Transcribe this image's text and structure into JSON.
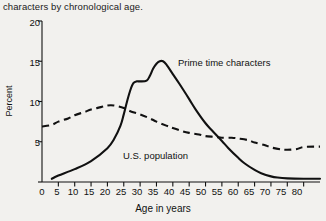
{
  "caption": "characters by chronological age.",
  "axis": {
    "ylabel": "Percent",
    "xlabel": "Age in years",
    "yticks": [
      "0",
      "5",
      "10",
      "15",
      "20"
    ],
    "xticks": [
      "0",
      "5",
      "10",
      "15",
      "20",
      "25",
      "30",
      "35",
      "40",
      "45",
      "50",
      "55",
      "60",
      "65",
      "70",
      "75",
      "80"
    ]
  },
  "labels": {
    "series1": "Prime time characters",
    "series2": "U.S. population"
  },
  "colors": {
    "ink": "#111111",
    "background": "#f2f1ee"
  },
  "chart_data": {
    "type": "line",
    "title": "characters by chronological age.",
    "xlabel": "Age in years",
    "ylabel": "Percent",
    "xlim": [
      0,
      85
    ],
    "ylim": [
      0,
      20
    ],
    "xticks": [
      0,
      5,
      10,
      15,
      20,
      25,
      30,
      35,
      40,
      45,
      50,
      55,
      60,
      65,
      70,
      75,
      80
    ],
    "yticks": [
      0,
      5,
      10,
      15,
      20
    ],
    "grid": false,
    "legend": "inline-annotations",
    "series": [
      {
        "name": "Prime time characters",
        "style": "solid",
        "x": [
          3,
          5,
          10,
          15,
          20,
          22,
          24,
          25,
          26,
          27,
          28,
          29,
          30,
          32,
          33,
          34,
          35,
          36,
          37,
          38,
          40,
          42,
          45,
          47,
          50,
          52,
          55,
          57,
          60,
          62,
          65,
          67,
          70,
          72,
          75,
          80,
          85
        ],
        "y": [
          0.4,
          0.8,
          1.6,
          2.6,
          4.2,
          5.3,
          7.0,
          8.4,
          10.0,
          11.4,
          12.3,
          12.5,
          12.5,
          12.6,
          13.2,
          14.1,
          14.7,
          15.0,
          15.0,
          14.6,
          13.4,
          12.2,
          10.3,
          9.0,
          7.3,
          6.4,
          5.1,
          4.2,
          3.0,
          2.3,
          1.5,
          1.1,
          0.7,
          0.55,
          0.45,
          0.4,
          0.4
        ]
      },
      {
        "name": "U.S. population",
        "style": "dashed",
        "x": [
          0,
          3,
          5,
          8,
          10,
          13,
          15,
          18,
          20,
          22,
          25,
          27,
          30,
          33,
          35,
          38,
          40,
          43,
          45,
          48,
          50,
          53,
          55,
          58,
          60,
          63,
          65,
          68,
          70,
          73,
          75,
          78,
          80,
          85
        ],
        "y": [
          6.9,
          7.1,
          7.5,
          7.9,
          8.3,
          8.7,
          9.0,
          9.3,
          9.5,
          9.5,
          9.2,
          8.8,
          8.4,
          7.9,
          7.5,
          7.0,
          6.7,
          6.3,
          6.1,
          5.9,
          5.7,
          5.6,
          5.5,
          5.5,
          5.4,
          5.2,
          4.9,
          4.6,
          4.3,
          4.05,
          4.0,
          4.1,
          4.35,
          4.4
        ]
      }
    ]
  }
}
